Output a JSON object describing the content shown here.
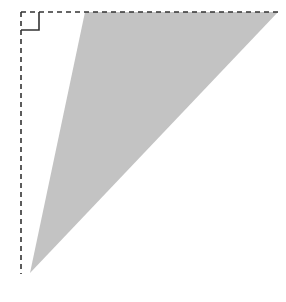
{
  "figure": {
    "canvas": {
      "width": 286,
      "height": 302,
      "background": "#ffffff"
    },
    "shapes": {
      "triangle": {
        "name": "shaded-triangle",
        "fill": "#c3c3c3",
        "stroke": "none",
        "points": "85,12 278,12 30,273",
        "vertices": [
          {
            "label": "top-left-vertex",
            "x": 85,
            "y": 12
          },
          {
            "label": "top-right-vertex",
            "x": 278,
            "y": 12
          },
          {
            "label": "bottom-apex-vertex",
            "x": 30,
            "y": 273
          }
        ]
      },
      "dashed_top_edge": {
        "name": "dashed-horizontal-line",
        "stroke": "#333333",
        "stroke_width": 1.6,
        "dash_pattern": "5,4",
        "x1": 21,
        "y1": 12,
        "x2": 278,
        "y2": 12
      },
      "dashed_left_edge": {
        "name": "dashed-vertical-line",
        "stroke": "#333333",
        "stroke_width": 1.6,
        "dash_pattern": "5,4",
        "x1": 21,
        "y1": 12,
        "x2": 21,
        "y2": 274
      },
      "right_angle_marker": {
        "name": "right-angle-marker",
        "stroke": "#333333",
        "stroke_width": 1.6,
        "fill": "none",
        "path": "M 21 30 L 39 30 L 39 12",
        "size": 18,
        "corner": {
          "x": 21,
          "y": 12
        }
      }
    }
  }
}
